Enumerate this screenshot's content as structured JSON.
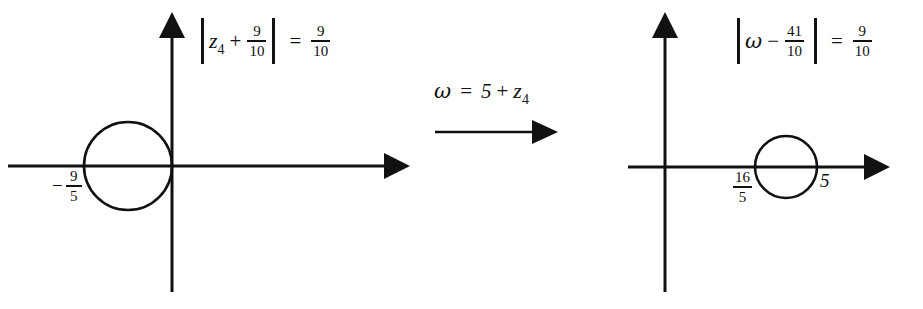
{
  "figure": {
    "stroke_color": "#111111",
    "background": "#ffffff"
  },
  "left_panel": {
    "name": "z-plane",
    "equation": {
      "open_bar": "|",
      "variable": "z",
      "subscript": "4",
      "operator": "+",
      "lhs_fraction": {
        "numerator": "9",
        "denominator": "10"
      },
      "close_bar": "|",
      "equals": "=",
      "rhs_fraction": {
        "numerator": "9",
        "denominator": "10"
      },
      "plain_text": "|z4 + 9/10| = 9/10"
    },
    "axis_tick": {
      "sign": "−",
      "numerator": "9",
      "denominator": "5",
      "plain_text": "-9/5"
    },
    "circle": {
      "center_x": -0.9,
      "center_y": 0,
      "radius": 0.9
    }
  },
  "map_panel": {
    "label": {
      "omega": "ω",
      "equals": "=",
      "constant": "5",
      "operator": "+",
      "variable": "z",
      "subscript": "4",
      "plain_text": "ω = 5 + z4"
    },
    "arrow": "right-arrow"
  },
  "right_panel": {
    "name": "omega-plane",
    "equation": {
      "open_bar": "|",
      "variable": "ω",
      "operator": "−",
      "lhs_fraction": {
        "numerator": "41",
        "denominator": "10"
      },
      "close_bar": "|",
      "equals": "=",
      "rhs_fraction": {
        "numerator": "9",
        "denominator": "10"
      },
      "plain_text": "|ω - 41/10| = 9/10"
    },
    "axis_tick_left": {
      "numerator": "16",
      "denominator": "5",
      "plain_text": "16/5"
    },
    "axis_tick_right": {
      "value": "5"
    },
    "circle": {
      "center_x": 4.1,
      "center_y": 0,
      "radius": 0.9
    }
  }
}
